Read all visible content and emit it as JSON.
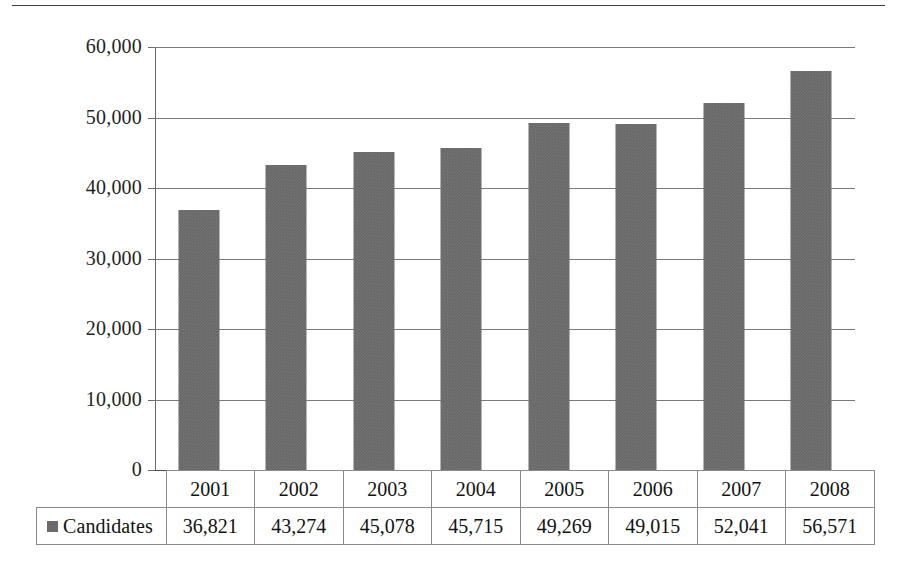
{
  "chart_data": {
    "type": "bar",
    "title": "",
    "xlabel": "",
    "ylabel": "",
    "categories": [
      "2001",
      "2002",
      "2003",
      "2004",
      "2005",
      "2006",
      "2007",
      "2008"
    ],
    "values": [
      36821,
      43274,
      45078,
      45715,
      49269,
      49015,
      52041,
      56571
    ],
    "value_labels": [
      "36,821",
      "43,274",
      "45,078",
      "45,715",
      "49,269",
      "49,015",
      "52,041",
      "56,571"
    ],
    "series": [
      {
        "name": "Candidates",
        "values": [
          36821,
          43274,
          45078,
          45715,
          49269,
          49015,
          52041,
          56571
        ],
        "color": "#666666"
      }
    ],
    "ylim": [
      0,
      60000
    ],
    "yticks": [
      0,
      10000,
      20000,
      30000,
      40000,
      50000,
      60000
    ],
    "ytick_labels": [
      "0",
      "10,000",
      "20,000",
      "30,000",
      "40,000",
      "50,000",
      "60,000"
    ],
    "grid": true,
    "legend": {
      "position": "table-left",
      "entries": [
        {
          "label": "Candidates",
          "color": "#666666",
          "marker": "square-swatch"
        }
      ]
    },
    "data_table": {
      "visible": true,
      "header_row": [
        "2001",
        "2002",
        "2003",
        "2004",
        "2005",
        "2006",
        "2007",
        "2008"
      ],
      "rows": [
        {
          "label": "Candidates",
          "cells": [
            "36,821",
            "43,274",
            "45,078",
            "45,715",
            "49,269",
            "49,015",
            "52,041",
            "56,571"
          ]
        }
      ]
    },
    "colors": {
      "bar": "#666666",
      "gridline": "#7a7a7a",
      "axis": "#6b6b6b",
      "text": "#1a1a1a",
      "background": "#ffffff",
      "table_border": "#8a8a8a"
    }
  }
}
